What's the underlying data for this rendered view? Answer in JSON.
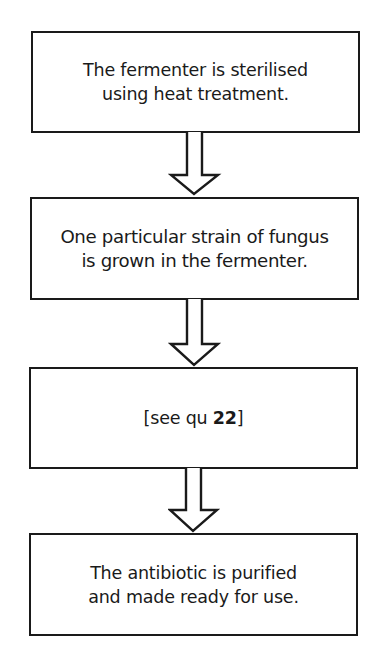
{
  "diagram": {
    "type": "flowchart",
    "direction": "top-to-bottom",
    "steps": [
      {
        "id": 1,
        "text": "The fermenter is sterilised\nusing heat treatment."
      },
      {
        "id": 2,
        "text": "One particular strain of fungus\nis grown in the fermenter."
      },
      {
        "id": 3,
        "text_prefix": "[see qu ",
        "text_bold": "22",
        "text_suffix": "]"
      },
      {
        "id": 4,
        "text": "The antibiotic is purified\nand made ready for use."
      }
    ],
    "arrows": [
      {
        "from": 1,
        "to": 2,
        "icon": "hollow-down-arrow-icon"
      },
      {
        "from": 2,
        "to": 3,
        "icon": "hollow-down-arrow-icon"
      },
      {
        "from": 3,
        "to": 4,
        "icon": "hollow-down-arrow-icon"
      }
    ]
  },
  "colors": {
    "stroke": "#1a1a1a",
    "background": "#ffffff",
    "text": "#1a1a1a"
  }
}
